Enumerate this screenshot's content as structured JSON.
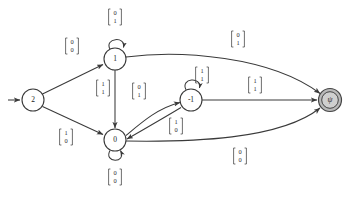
{
  "figure": {
    "name": "finite-state-transducer-diagram",
    "type": "state-transition-diagram",
    "background_color": "#ffffff",
    "stroke_color": "#3a3a3a",
    "accept_fill_color": "#b9b9b9"
  },
  "states": [
    {
      "id": "s2",
      "label": "2",
      "cx": 33,
      "cy": 100,
      "r": 11,
      "kind": "start",
      "initial": true,
      "accepting": false
    },
    {
      "id": "s1",
      "label": "1",
      "cx": 115,
      "cy": 59,
      "r": 11,
      "kind": "normal",
      "initial": false,
      "accepting": false
    },
    {
      "id": "s0",
      "label": "0",
      "cx": 115,
      "cy": 140,
      "r": 11,
      "kind": "normal",
      "initial": false,
      "accepting": false
    },
    {
      "id": "sm1",
      "label": "-1",
      "cx": 191,
      "cy": 100,
      "r": 11,
      "kind": "normal",
      "initial": false,
      "accepting": false
    },
    {
      "id": "spsi",
      "label": "ψ",
      "cx": 330,
      "cy": 100,
      "r": 11.5,
      "kind": "accepting",
      "initial": false,
      "accepting": true
    }
  ],
  "start_arrow": {
    "from_x": 8,
    "to_x": 21,
    "y": 100
  },
  "transitions": [
    {
      "id": "t-2-1",
      "from": "s2",
      "to": "s1",
      "label_top": "0",
      "label_bottom": "0",
      "label_x": 72,
      "label_y": 46,
      "shape": "line"
    },
    {
      "id": "t-2-0",
      "from": "s2",
      "to": "s0",
      "label_top": "1",
      "label_bottom": "0",
      "label_x": 66,
      "label_y": 137,
      "shape": "line"
    },
    {
      "id": "t-1-1",
      "from": "s1",
      "to": "s1",
      "label_top": "0",
      "label_bottom": "1",
      "label_x": 115,
      "label_y": 17,
      "shape": "self-loop-top"
    },
    {
      "id": "t-1-0",
      "from": "s1",
      "to": "s0",
      "label_top": "1",
      "label_bottom": "1",
      "label_x": 103,
      "label_y": 88,
      "shape": "line-vertical"
    },
    {
      "id": "t-1-psi",
      "from": "s1",
      "to": "spsi",
      "label_top": "0",
      "label_bottom": "1",
      "label_x": 238,
      "label_y": 39,
      "shape": "curve"
    },
    {
      "id": "t-0-0",
      "from": "s0",
      "to": "s0",
      "label_top": "0",
      "label_bottom": "0",
      "label_x": 115,
      "label_y": 177,
      "shape": "self-loop-bottom"
    },
    {
      "id": "t-0-m1",
      "from": "s0",
      "to": "sm1",
      "label_top": "0",
      "label_bottom": "1",
      "label_x": 139,
      "label_y": 91,
      "shape": "curve"
    },
    {
      "id": "t-m1-0",
      "from": "sm1",
      "to": "s0",
      "label_top": "1",
      "label_bottom": "0",
      "label_x": 176,
      "label_y": 126,
      "shape": "curve"
    },
    {
      "id": "t-m1-m1",
      "from": "sm1",
      "to": "sm1",
      "label_top": "1",
      "label_bottom": "1",
      "label_x": 202,
      "label_y": 75,
      "shape": "self-loop-top"
    },
    {
      "id": "t-m1-psi",
      "from": "sm1",
      "to": "spsi",
      "label_top": "1",
      "label_bottom": "1",
      "label_x": 255,
      "label_y": 85,
      "shape": "line"
    },
    {
      "id": "t-0-psi",
      "from": "s0",
      "to": "spsi",
      "label_top": "0",
      "label_bottom": "0",
      "label_x": 240,
      "label_y": 156,
      "shape": "curve"
    }
  ]
}
